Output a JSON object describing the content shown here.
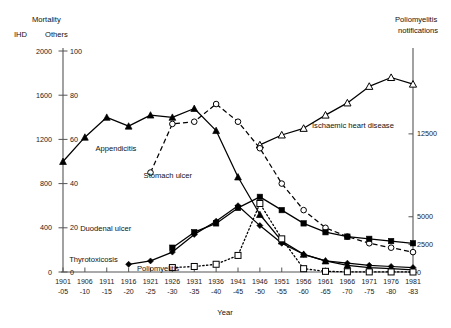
{
  "figure": {
    "headers": {
      "mortality": "Mortality",
      "ihd": "IHD",
      "others": "Others",
      "right_axis_line1": "Poliomyelitis",
      "right_axis_line2": "notifications",
      "xlabel": "Year"
    }
  },
  "chart_data": {
    "type": "line",
    "title": "",
    "xlabel": "Year",
    "ylabel": "Mortality",
    "grid": false,
    "legend": "inline-annotations",
    "categories": [
      "1901\n-05",
      "1906\n-10",
      "1911\n-15",
      "1916\n-20",
      "1921\n-25",
      "1926\n-30",
      "1931\n-35",
      "1936\n-40",
      "1941\n-45",
      "1946\n-50",
      "1951\n-55",
      "1956\n-60",
      "1961\n-65",
      "1966\n-70",
      "1971\n-75",
      "1976\n-80",
      "1981\n-83"
    ],
    "x_tick_top": [
      "1901",
      "1906",
      "1911",
      "1916",
      "1921",
      "1926",
      "1931",
      "1936",
      "1941",
      "1946",
      "1951",
      "1956",
      "1961",
      "1966",
      "1971",
      "1976",
      "1981"
    ],
    "x_tick_bottom": [
      "-05",
      "-10",
      "-15",
      "-20",
      "-25",
      "-30",
      "-35",
      "-40",
      "-45",
      "-50",
      "-55",
      "-60",
      "-65",
      "-70",
      "-75",
      "-80",
      "-83"
    ],
    "axes": {
      "left_ihd": {
        "label": "IHD",
        "ticks": [
          2000,
          1600,
          1200,
          800,
          400,
          0
        ],
        "ylim": [
          0,
          2000
        ]
      },
      "left_others": {
        "label": "Others",
        "ticks": [
          100,
          80,
          60,
          40,
          20,
          0
        ],
        "ylim": [
          0,
          100
        ]
      },
      "right_polio": {
        "label": "Poliomyelitis notifications",
        "ticks": [
          12500,
          5000,
          2500,
          0
        ],
        "ylim": [
          0,
          20000
        ]
      }
    },
    "series": [
      {
        "name": "Ischaemic heart disease",
        "axis": "left_ihd",
        "marker": "open-triangle",
        "line": "solid",
        "values": [
          null,
          null,
          null,
          null,
          null,
          null,
          null,
          null,
          null,
          1150,
          1240,
          1300,
          1420,
          1530,
          1680,
          1760,
          1700
        ]
      },
      {
        "name": "Appendicitis",
        "axis": "left_others",
        "marker": "filled-triangle",
        "line": "solid",
        "values": [
          50,
          61,
          70,
          66,
          71,
          70,
          74,
          64,
          43,
          26,
          14,
          8,
          5,
          3,
          2,
          1.5,
          1
        ]
      },
      {
        "name": "Stomach ulcer",
        "axis": "left_others",
        "marker": "open-circle",
        "line": "dashed",
        "values": [
          null,
          null,
          null,
          null,
          45,
          67,
          68,
          76,
          68,
          56,
          40,
          28,
          20,
          16,
          13,
          11,
          9
        ]
      },
      {
        "name": "Duodenal ulcer",
        "axis": "left_others",
        "marker": "filled-square",
        "line": "solid",
        "values": [
          null,
          null,
          null,
          null,
          null,
          11,
          18,
          22,
          29,
          34,
          28,
          22,
          18,
          16,
          15,
          14,
          13
        ]
      },
      {
        "name": "Thyrotoxicosis",
        "axis": "left_others",
        "marker": "filled-diamond",
        "line": "solid",
        "values": [
          null,
          null,
          null,
          3.5,
          5,
          9,
          17,
          23,
          30,
          21,
          13,
          8,
          5,
          4,
          3,
          2.5,
          2
        ]
      },
      {
        "name": "Poliomyelitis",
        "axis": "right_polio",
        "marker": "open-square",
        "line": "dotted",
        "values": [
          null,
          null,
          null,
          null,
          null,
          400,
          500,
          700,
          1500,
          6200,
          3000,
          300,
          60,
          20,
          10,
          5,
          0
        ]
      }
    ],
    "annotations": [
      {
        "text": "Ischaemic heart disease",
        "x_index": 11.2,
        "y_value": 1330,
        "axis": "left_ihd"
      },
      {
        "text": "Appendicitis",
        "x_index": 1.3,
        "y_value": 56,
        "axis": "left_others"
      },
      {
        "text": "Stomach ulcer",
        "x_index": 3.5,
        "y_value": 44,
        "axis": "left_others"
      },
      {
        "text": "Duodenal ulcer",
        "x_index": 0.6,
        "y_value": 20,
        "axis": "left_others"
      },
      {
        "text": "Thyrotoxicosis",
        "x_index": 0.1,
        "y_value": 6,
        "axis": "left_others"
      },
      {
        "text": "Poliomyelitis",
        "x_index": 3.2,
        "y_value": 2,
        "axis": "left_others"
      }
    ]
  }
}
